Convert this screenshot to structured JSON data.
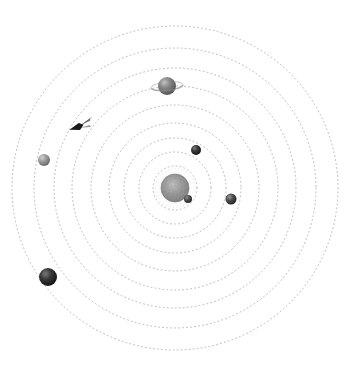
{
  "scene": {
    "title": "Solar System Orbital Diagram",
    "width": 351,
    "height": 366,
    "background_color": "#ffffff",
    "center_x": 175,
    "center_y": 188
  },
  "orbits": {
    "style": "dotted",
    "stroke_color": "#9a9a9a",
    "dash_pattern": "1 3",
    "stroke_width": 0.8,
    "rings": [
      {
        "name": "orbit-1",
        "radius_x": 22,
        "radius_y": 22,
        "label": "Mercury orbit"
      },
      {
        "name": "orbit-2",
        "radius_x": 36,
        "radius_y": 36,
        "label": "Venus orbit"
      },
      {
        "name": "orbit-3",
        "radius_x": 51,
        "radius_y": 50,
        "label": "Earth orbit"
      },
      {
        "name": "orbit-4",
        "radius_x": 66,
        "radius_y": 65,
        "label": "Mars orbit"
      },
      {
        "name": "orbit-5",
        "radius_x": 84,
        "radius_y": 83,
        "label": "Jupiter orbit"
      },
      {
        "name": "orbit-6",
        "radius_x": 103,
        "radius_y": 102,
        "label": "Saturn orbit"
      },
      {
        "name": "orbit-7",
        "radius_x": 121,
        "radius_y": 120,
        "label": "Uranus orbit"
      },
      {
        "name": "orbit-8",
        "radius_x": 141,
        "radius_y": 140,
        "label": "Neptune orbit"
      },
      {
        "name": "orbit-9",
        "radius_x": 163,
        "radius_y": 162,
        "label": "Pluto orbit"
      }
    ]
  },
  "sun": {
    "name": "sun",
    "label": "Sun",
    "x": 175,
    "y": 188,
    "radius": 14,
    "core_color": "#9b9b9b",
    "edge_color": "#6e6e6e",
    "halo_color": "#e8e8e8",
    "halo_radius": 21,
    "texture": "mottled"
  },
  "planets": [
    {
      "name": "planet-inner-small",
      "label": "Inner planet",
      "x": 188,
      "y": 199,
      "radius": 4,
      "color": "#2a2a2a",
      "highlight_color": "#777777",
      "orbit_ring": "orbit-1"
    },
    {
      "name": "planet-upper-dark",
      "label": "Second planet",
      "x": 196,
      "y": 150,
      "radius": 5,
      "color": "#1d1d1d",
      "highlight_color": "#6e6e6e",
      "orbit_ring": "orbit-4"
    },
    {
      "name": "planet-right-dark",
      "label": "Third planet",
      "x": 231,
      "y": 199,
      "radius": 5.5,
      "color": "#262626",
      "highlight_color": "#8a8a8a",
      "orbit_ring": "orbit-5"
    },
    {
      "name": "planet-ringed",
      "label": "Ringed planet",
      "x": 167,
      "y": 86,
      "radius": 9,
      "color": "#6f6f6f",
      "highlight_color": "#b9b9b9",
      "has_rings": true,
      "ring_color": "#8d8d8d",
      "ring_radius_x": 16,
      "ring_radius_y": 4,
      "orbit_ring": "orbit-6"
    },
    {
      "name": "planet-left-gray",
      "label": "Outer gray planet",
      "x": 44,
      "y": 160,
      "radius": 6,
      "color": "#848484",
      "highlight_color": "#c6c6c6",
      "orbit_ring": "orbit-8"
    },
    {
      "name": "planet-lowerleft-dark",
      "label": "Outermost planet",
      "x": 48,
      "y": 277,
      "radius": 9,
      "color": "#111111",
      "highlight_color": "#626262",
      "orbit_ring": "orbit-9"
    }
  ],
  "comet": {
    "name": "comet",
    "label": "Comet",
    "x": 78,
    "y": 127,
    "body_color": "#1a1a1a",
    "tail_color": "#5a5a5a",
    "length": 26,
    "rotation_deg": -18
  }
}
